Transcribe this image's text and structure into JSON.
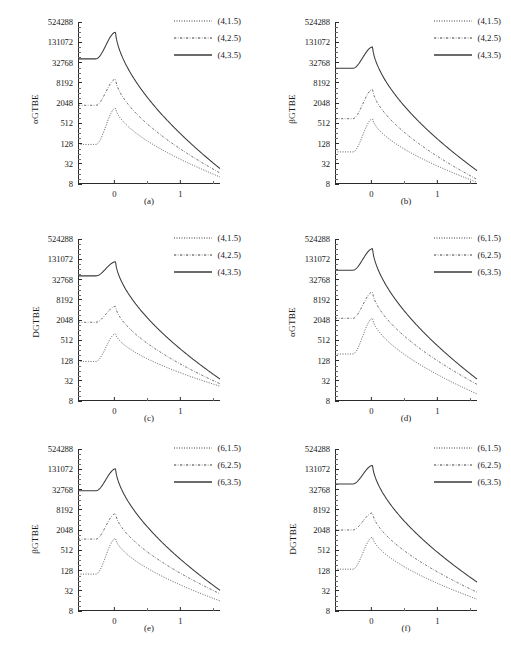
{
  "chart_data": [
    {
      "type": "line",
      "panel": "a",
      "sublabel": "(a)",
      "ylabel": "αGTBE",
      "xlabel": "",
      "yticks": [
        8,
        32,
        128,
        512,
        2048,
        8192,
        32768,
        131072,
        524288
      ],
      "ytick_labels": [
        "8",
        "32",
        "128",
        "512",
        "2048",
        "8192",
        "32768",
        "131072",
        "524288"
      ],
      "xticks": [
        0,
        1
      ],
      "xtick_labels": [
        "0",
        "1"
      ],
      "xlim": [
        -0.55,
        1.6
      ],
      "ylim": [
        8,
        524288
      ],
      "yscale": "log4",
      "grid": false,
      "legend_position": "top-right",
      "series": [
        {
          "name": "(4,1.5)",
          "style": "dotted",
          "plateau": 120,
          "peak_y": 1450,
          "peak_x": 0.02,
          "end_y": 13
        },
        {
          "name": "(4,2.5)",
          "style": "dashdot",
          "plateau": 1750,
          "peak_y": 10500,
          "peak_x": 0.02,
          "end_y": 17
        },
        {
          "name": "(4,3.5)",
          "style": "solid",
          "plateau": 42000,
          "peak_y": 260000,
          "peak_x": 0.02,
          "end_y": 23
        }
      ]
    },
    {
      "type": "line",
      "panel": "b",
      "sublabel": "(b)",
      "ylabel": "βGTBE",
      "xlabel": "",
      "yticks": [
        8,
        32,
        128,
        512,
        2048,
        8192,
        32768,
        131072,
        524288
      ],
      "ytick_labels": [
        "8",
        "32",
        "128",
        "512",
        "2048",
        "8192",
        "32768",
        "131072",
        "524288"
      ],
      "xticks": [
        0,
        1
      ],
      "xtick_labels": [
        "0",
        "1"
      ],
      "xlim": [
        -0.55,
        1.6
      ],
      "ylim": [
        8,
        524288
      ],
      "yscale": "log4",
      "grid": false,
      "legend_position": "top-right",
      "series": [
        {
          "name": "(4,1.5)",
          "style": "dotted",
          "plateau": 72,
          "peak_y": 700,
          "peak_x": 0.02,
          "end_y": 9
        },
        {
          "name": "(4,2.5)",
          "style": "dashdot",
          "plateau": 700,
          "peak_y": 5200,
          "peak_x": 0.02,
          "end_y": 11
        },
        {
          "name": "(4,3.5)",
          "style": "solid",
          "plateau": 22000,
          "peak_y": 95000,
          "peak_x": 0.02,
          "end_y": 20
        }
      ]
    },
    {
      "type": "line",
      "panel": "c",
      "sublabel": "(c)",
      "ylabel": "DGTBE",
      "xlabel": "",
      "yticks": [
        8,
        32,
        128,
        512,
        2048,
        8192,
        32768,
        131072,
        524288
      ],
      "ytick_labels": [
        "8",
        "32",
        "128",
        "512",
        "2048",
        "8192",
        "32768",
        "131072",
        "524288"
      ],
      "xticks": [
        0,
        1
      ],
      "xtick_labels": [
        "0",
        "1"
      ],
      "xlim": [
        -0.55,
        1.6
      ],
      "ylim": [
        8,
        524288
      ],
      "yscale": "log4",
      "grid": false,
      "legend_position": "top-right",
      "series": [
        {
          "name": "(4,1.5)",
          "style": "dotted",
          "plateau": 120,
          "peak_y": 800,
          "peak_x": 0.02,
          "end_y": 22
        },
        {
          "name": "(4,2.5)",
          "style": "dashdot",
          "plateau": 1750,
          "peak_y": 5200,
          "peak_x": 0.02,
          "end_y": 26
        },
        {
          "name": "(4,3.5)",
          "style": "solid",
          "plateau": 42000,
          "peak_y": 110000,
          "peak_x": 0.02,
          "end_y": 36
        }
      ]
    },
    {
      "type": "line",
      "panel": "d",
      "sublabel": "(d)",
      "ylabel": "αGTBE",
      "xlabel": "",
      "yticks": [
        8,
        32,
        128,
        512,
        2048,
        8192,
        32768,
        131072,
        524288
      ],
      "ytick_labels": [
        "8",
        "32",
        "128",
        "512",
        "2048",
        "8192",
        "32768",
        "131072",
        "524288"
      ],
      "xticks": [
        0,
        1
      ],
      "xtick_labels": [
        "0",
        "1"
      ],
      "xlim": [
        -0.55,
        1.6
      ],
      "ylim": [
        8,
        524288
      ],
      "yscale": "log4",
      "grid": false,
      "legend_position": "top-right",
      "series": [
        {
          "name": "(6,1.5)",
          "style": "dotted",
          "plateau": 200,
          "peak_y": 2300,
          "peak_x": 0.02,
          "end_y": 13
        },
        {
          "name": "(6,2.5)",
          "style": "dashdot",
          "plateau": 2300,
          "peak_y": 14000,
          "peak_x": 0.02,
          "end_y": 25
        },
        {
          "name": "(6,3.5)",
          "style": "solid",
          "plateau": 62000,
          "peak_y": 270000,
          "peak_x": 0.02,
          "end_y": 36
        }
      ]
    },
    {
      "type": "line",
      "panel": "e",
      "sublabel": "(e)",
      "ylabel": "βGTBE",
      "xlabel": "",
      "yticks": [
        8,
        32,
        128,
        512,
        2048,
        8192,
        32768,
        131072,
        524288
      ],
      "ytick_labels": [
        "8",
        "32",
        "128",
        "512",
        "2048",
        "8192",
        "32768",
        "131072",
        "524288"
      ],
      "xticks": [
        0,
        1
      ],
      "xtick_labels": [
        "0",
        "1"
      ],
      "xlim": [
        -0.55,
        1.6
      ],
      "ylim": [
        8,
        524288
      ],
      "yscale": "log4",
      "grid": false,
      "legend_position": "top-right",
      "series": [
        {
          "name": "(6,1.5)",
          "style": "dotted",
          "plateau": 100,
          "peak_y": 1150,
          "peak_x": 0.02,
          "end_y": 16
        },
        {
          "name": "(6,2.5)",
          "style": "dashdot",
          "plateau": 1100,
          "peak_y": 6300,
          "peak_x": 0.02,
          "end_y": 26
        },
        {
          "name": "(6,3.5)",
          "style": "solid",
          "plateau": 30000,
          "peak_y": 135000,
          "peak_x": 0.02,
          "end_y": 33
        }
      ]
    },
    {
      "type": "line",
      "panel": "f",
      "sublabel": "(f)",
      "ylabel": "DGTBE",
      "xlabel": "",
      "yticks": [
        8,
        32,
        128,
        512,
        2048,
        8192,
        32768,
        131072,
        524288
      ],
      "ytick_labels": [
        "8",
        "32",
        "128",
        "512",
        "2048",
        "8192",
        "32768",
        "131072",
        "524288"
      ],
      "xticks": [
        0,
        1
      ],
      "xtick_labels": [
        "0",
        "1"
      ],
      "xlim": [
        -0.55,
        1.6
      ],
      "ylim": [
        8,
        524288
      ],
      "yscale": "log4",
      "grid": false,
      "legend_position": "top-right",
      "series": [
        {
          "name": "(6,1.5)",
          "style": "dotted",
          "plateau": 140,
          "peak_y": 1250,
          "peak_x": 0.02,
          "end_y": 18
        },
        {
          "name": "(6,2.5)",
          "style": "dashdot",
          "plateau": 2050,
          "peak_y": 6600,
          "peak_x": 0.02,
          "end_y": 29
        },
        {
          "name": "(6,3.5)",
          "style": "solid",
          "plateau": 48000,
          "peak_y": 170000,
          "peak_x": 0.02,
          "end_y": 58
        }
      ]
    }
  ],
  "style": {
    "curve_color": "#3a3a3a",
    "axis_color": "#2b2b2b",
    "background": "#ffffff"
  }
}
